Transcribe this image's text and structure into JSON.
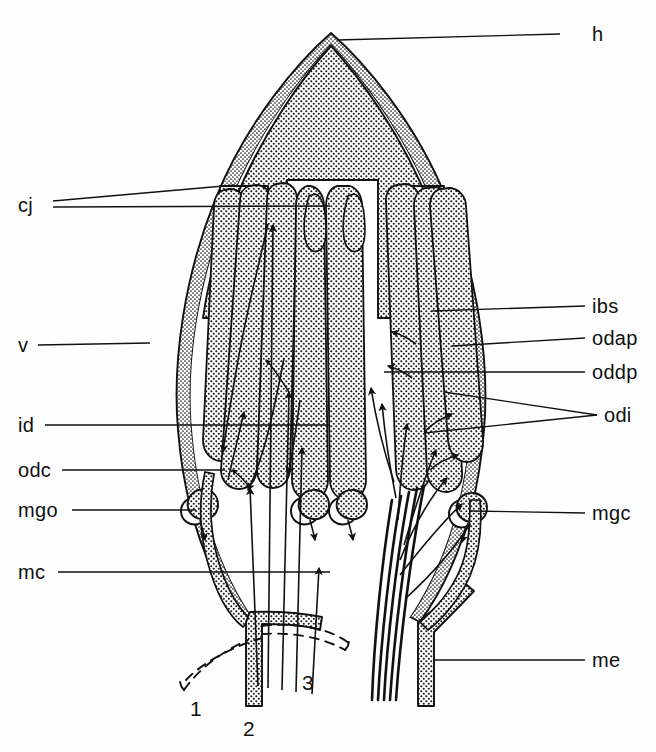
{
  "figure": {
    "kind": "anatomical-schematic",
    "background_color": "#fefefe",
    "ink_color": "#111111",
    "stipple_color": "#1a1a1a"
  },
  "labels": {
    "right": [
      {
        "id": "h",
        "text": "h",
        "x": 592,
        "y": 34,
        "leader": {
          "x1": 560,
          "y1": 34,
          "x2": 337,
          "y2": 40
        }
      },
      {
        "id": "ibs",
        "text": "ibs",
        "x": 592,
        "y": 306,
        "leader": {
          "x1": 585,
          "y1": 306,
          "x2": 432,
          "y2": 311
        }
      },
      {
        "id": "odap",
        "text": "odap",
        "x": 592,
        "y": 338,
        "leader": {
          "x1": 585,
          "y1": 338,
          "x2": 452,
          "y2": 346
        }
      },
      {
        "id": "oddp",
        "text": "oddp",
        "x": 592,
        "y": 372,
        "leader": {
          "x1": 585,
          "y1": 372,
          "x2": 384,
          "y2": 372
        }
      },
      {
        "id": "odi",
        "text": "odi",
        "x": 604,
        "y": 415,
        "leader": {
          "x1": 597,
          "y1": 415,
          "x2": 444,
          "y2": 392
        }
      },
      {
        "id": "odi2",
        "text": "",
        "x": 0,
        "y": 0,
        "leader": {
          "x1": 597,
          "y1": 415,
          "x2": 424,
          "y2": 433
        }
      },
      {
        "id": "mgc",
        "text": "mgc",
        "x": 592,
        "y": 513,
        "leader": {
          "x1": 585,
          "y1": 513,
          "x2": 470,
          "y2": 511
        }
      },
      {
        "id": "me",
        "text": "me",
        "x": 592,
        "y": 660,
        "leader": {
          "x1": 585,
          "y1": 660,
          "x2": 434,
          "y2": 660
        }
      }
    ],
    "left": [
      {
        "id": "cj",
        "text": "cj",
        "x": 18,
        "y": 205,
        "leader": {
          "x1": 53,
          "y1": 201,
          "x2": 235,
          "y2": 185
        }
      },
      {
        "id": "cj2",
        "text": "",
        "x": 0,
        "y": 0,
        "leader": {
          "x1": 53,
          "y1": 207,
          "x2": 330,
          "y2": 206
        }
      },
      {
        "id": "v",
        "text": "v",
        "x": 18,
        "y": 345,
        "leader": {
          "x1": 38,
          "y1": 345,
          "x2": 150,
          "y2": 343
        }
      },
      {
        "id": "id",
        "text": "id",
        "x": 18,
        "y": 425,
        "leader": {
          "x1": 45,
          "y1": 425,
          "x2": 330,
          "y2": 425
        }
      },
      {
        "id": "odc",
        "text": "odc",
        "x": 18,
        "y": 470,
        "leader": {
          "x1": 62,
          "y1": 470,
          "x2": 225,
          "y2": 470
        }
      },
      {
        "id": "mgo",
        "text": "mgo",
        "x": 18,
        "y": 510,
        "leader": {
          "x1": 72,
          "y1": 510,
          "x2": 196,
          "y2": 510
        }
      },
      {
        "id": "mc",
        "text": "mc",
        "x": 18,
        "y": 572,
        "leader": {
          "x1": 58,
          "y1": 572,
          "x2": 330,
          "y2": 572
        }
      }
    ]
  },
  "numbers": [
    {
      "id": "n1",
      "text": "1",
      "x": 190,
      "y": 698
    },
    {
      "id": "n2",
      "text": "2",
      "x": 243,
      "y": 718
    },
    {
      "id": "n3",
      "text": "3",
      "x": 302,
      "y": 672
    }
  ],
  "legend_keys": [
    "h",
    "cj",
    "v",
    "ibs",
    "odap",
    "oddp",
    "odi",
    "id",
    "odc",
    "mgo",
    "mgc",
    "mc",
    "me"
  ]
}
